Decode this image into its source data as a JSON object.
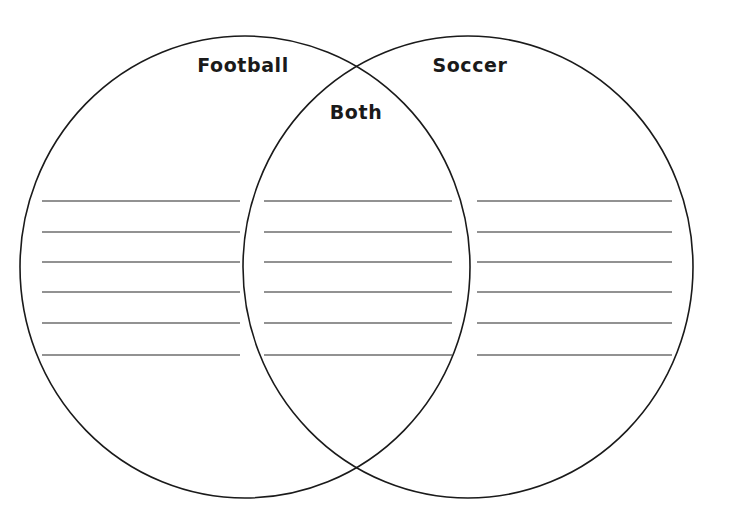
{
  "document": {
    "title": "Venn Diagram Worksheet",
    "type": "two-circle-venn-diagram",
    "background_color": "#ffffff"
  },
  "diagram": {
    "circle_stroke_color": "#1a1a1a",
    "circle_stroke_width": 1.6,
    "circle_fill": "none",
    "rule_line_color": "#6e6e6e",
    "rule_line_width": 1.5,
    "left_circle": {
      "cx": 245,
      "cy": 267,
      "rx": 225,
      "ry": 231
    },
    "right_circle": {
      "cx": 468,
      "cy": 267,
      "rx": 225,
      "ry": 231
    },
    "intersection_points": [
      {
        "x": 356,
        "y": 64
      },
      {
        "x": 356,
        "y": 470
      }
    ]
  },
  "labels": [
    {
      "id": "football",
      "text": "Football",
      "x": 243,
      "y": 65,
      "region": "left-only"
    },
    {
      "id": "soccer",
      "text": "Soccer",
      "x": 470,
      "y": 65,
      "region": "right-only"
    },
    {
      "id": "both",
      "text": "Both",
      "x": 356,
      "y": 112,
      "region": "intersection"
    }
  ],
  "sections": [
    {
      "id": "left",
      "label": "Football",
      "line_count": 6,
      "line_x_start": 42,
      "line_x_end": 240,
      "line_y_positions": [
        201,
        232,
        262,
        292,
        323,
        355
      ]
    },
    {
      "id": "middle",
      "label": "Both",
      "line_count": 6,
      "line_x_start": 264,
      "line_x_end": 452,
      "line_y_positions": [
        201,
        232,
        262,
        292,
        323,
        355
      ]
    },
    {
      "id": "right",
      "label": "Soccer",
      "line_count": 6,
      "line_x_start": 477,
      "line_x_end": 672,
      "line_y_positions": [
        201,
        232,
        262,
        292,
        323,
        355
      ]
    }
  ]
}
